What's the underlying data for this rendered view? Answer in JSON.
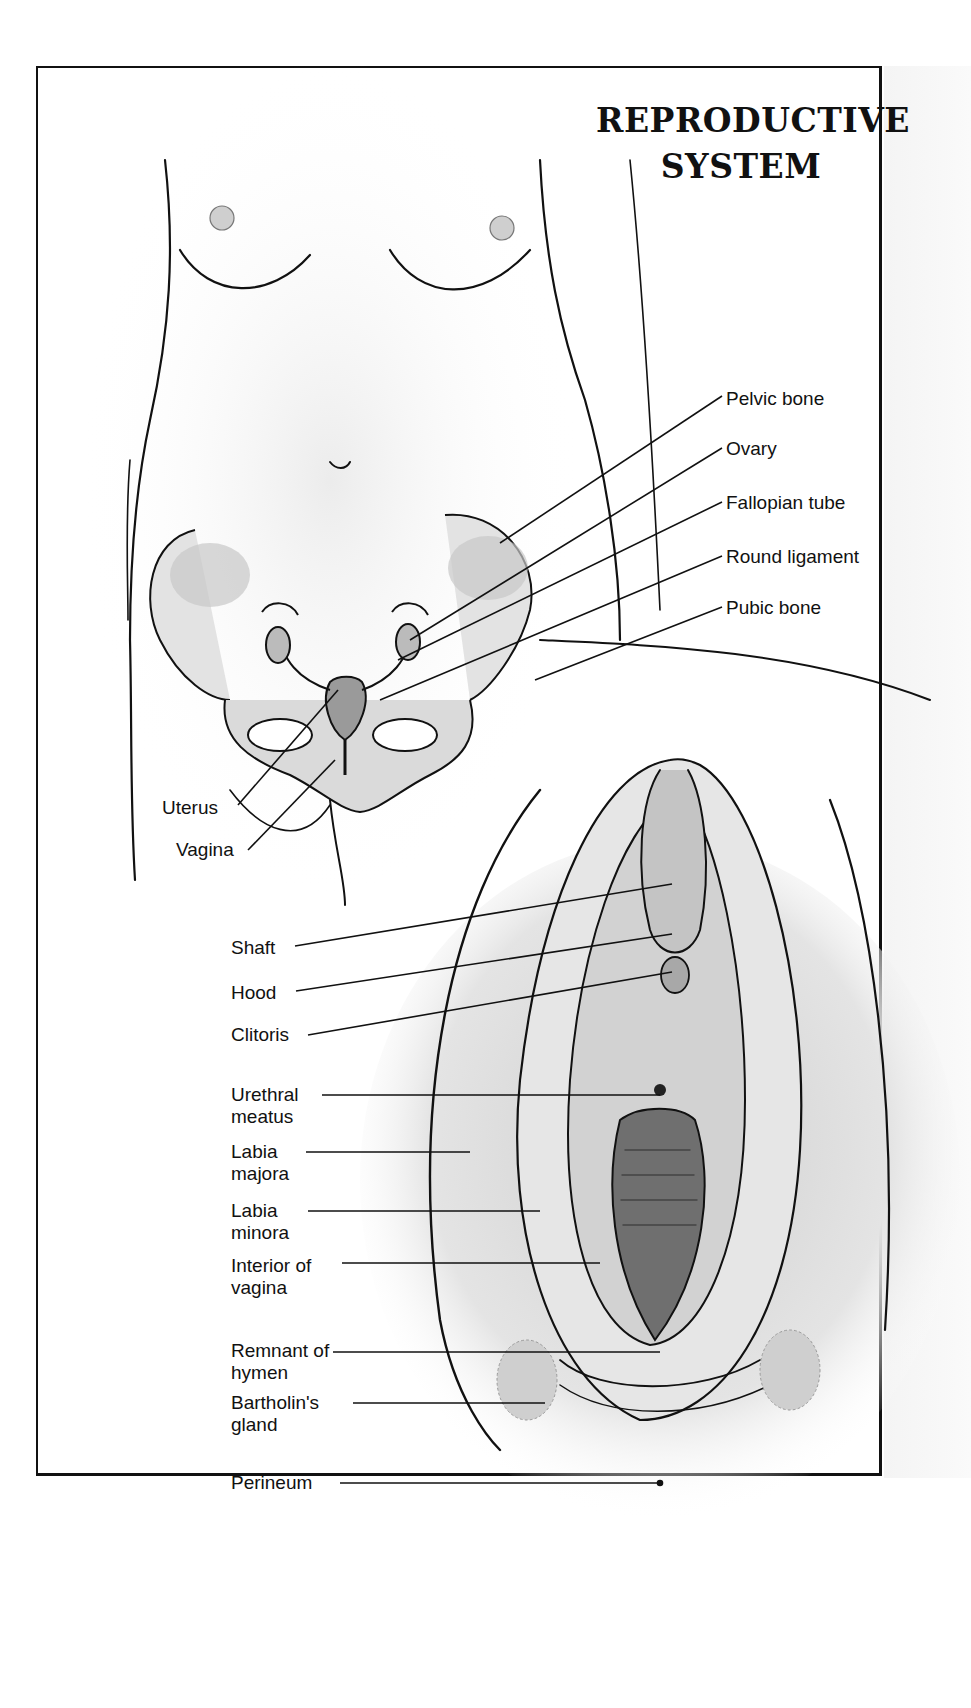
{
  "title": {
    "line1": "REPRODUCTIVE",
    "line2": "SYSTEM"
  },
  "figures": [
    {
      "name": "external-torso-view",
      "description": "Front view of female torso showing internal pelvic organs"
    },
    {
      "name": "external-genitalia-view",
      "description": "Close-up view of vulva"
    }
  ],
  "labels_upper_right": [
    {
      "text": "Pelvic bone"
    },
    {
      "text": "Ovary"
    },
    {
      "text": "Fallopian tube"
    },
    {
      "text": "Round ligament"
    },
    {
      "text": "Pubic bone"
    }
  ],
  "labels_upper_left": [
    {
      "text": "Uterus"
    },
    {
      "text": "Vagina"
    }
  ],
  "labels_lower_left": [
    {
      "text": "Shaft"
    },
    {
      "text": "Hood"
    },
    {
      "text": "Clitoris"
    },
    {
      "text": "Urethral meatus"
    },
    {
      "text": "Labia majora"
    },
    {
      "text": "Labia minora"
    },
    {
      "text": "Interior of vagina"
    },
    {
      "text": "Remnant of hymen"
    },
    {
      "text": "Bartholin's gland"
    },
    {
      "text": "Perineum"
    }
  ],
  "colors": {
    "ink": "#111111",
    "shade": "#b5b5b5",
    "background": "#ffffff"
  }
}
